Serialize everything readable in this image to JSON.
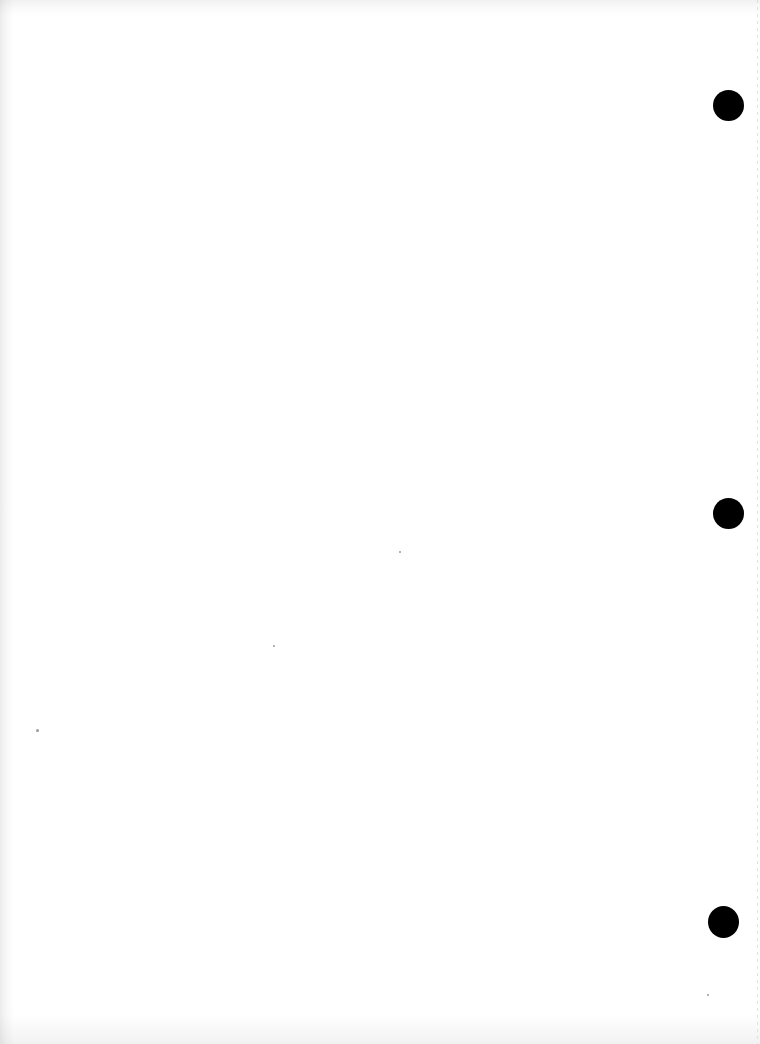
{
  "document": {
    "type": "blank scanned page",
    "text_content": "",
    "punch_holes": [
      {
        "position": "top-right",
        "x": 728,
        "y": 105
      },
      {
        "position": "middle-right",
        "x": 728,
        "y": 513
      },
      {
        "position": "bottom-right",
        "x": 723,
        "y": 922
      }
    ],
    "colors": {
      "paper": "#ffffff",
      "hole": "#000000",
      "edge_shadow": "#ececec"
    }
  }
}
